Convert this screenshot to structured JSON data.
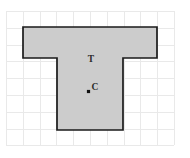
{
  "figure": {
    "name": "t-shape-on-grid",
    "background_color": "#ffffff",
    "grid": {
      "line_color": "#e9e9e9",
      "cell_size": 16.8,
      "columns": 10,
      "rows": 8,
      "origin_x": 6,
      "origin_y": 11
    },
    "shape": {
      "name": "tee-polygon",
      "fill_color": "#cccccc",
      "stroke_color": "#1a1a1a",
      "stroke_width": 1.7,
      "description": "T-shaped polygon",
      "points": "23,27 157,27 157,58 123,58 123,130 57,130 57,58 23,58"
    },
    "labels": [
      {
        "id": "shape-label",
        "text": "T",
        "x": 91,
        "y": 62,
        "color": "#2b2b2b"
      },
      {
        "id": "point-label",
        "text": "C",
        "x": 95,
        "y": 90,
        "color": "#2b2b2b"
      }
    ],
    "markers": [
      {
        "id": "centroid-point",
        "label": "C",
        "x": 88.5,
        "y": 91.5,
        "size": 3.2,
        "color": "#111111"
      }
    ]
  }
}
